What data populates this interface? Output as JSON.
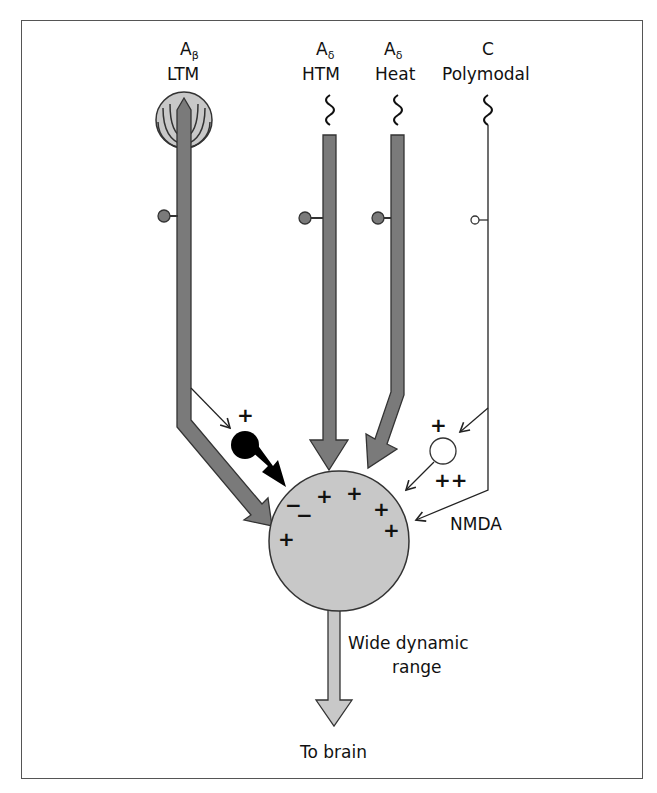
{
  "figure": {
    "fibers": [
      {
        "id": "abeta",
        "main": "A",
        "subscript": "β",
        "type": "LTM"
      },
      {
        "id": "adelta-htm",
        "main": "A",
        "subscript": "δ",
        "type": "HTM"
      },
      {
        "id": "adelta-heat",
        "main": "A",
        "subscript": "δ",
        "type": "Heat"
      },
      {
        "id": "c-polymodal",
        "main": "C",
        "subscript": "",
        "type": "Polymodal"
      }
    ],
    "interneuron_excitatory_sign": "+",
    "interneuron2_input_sign": "+",
    "interneuron2_output_sign": "++",
    "receptor_label": "NMDA",
    "neuron_charges": [
      "−",
      "−",
      "+",
      "+",
      "+",
      "+",
      "+"
    ],
    "neuron_label_line1": "Wide dynamic",
    "neuron_label_line2": "range",
    "output_label": "To brain"
  },
  "colors": {
    "fiber_fill": "#7a7a7a",
    "neuron_fill": "#c8c8c8",
    "outline": "#333333",
    "inhibitory_black": "#000000"
  }
}
